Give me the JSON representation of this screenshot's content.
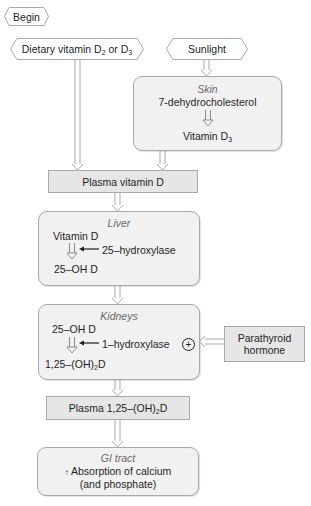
{
  "diagram": {
    "start": {
      "label": "Begin"
    },
    "sources": {
      "dietary": {
        "text": "Dietary vitamin D",
        "sub1": "2",
        "mid": " or D",
        "sub2": "3"
      },
      "sunlight": {
        "label": "Sunlight"
      }
    },
    "skin": {
      "title": "Skin",
      "substrate": "7-dehydrocholesterol",
      "product": {
        "text": "Vitamin D",
        "sub": "3"
      }
    },
    "plasma_vitamin_d": {
      "label": "Plasma vitamin D"
    },
    "liver": {
      "title": "Liver",
      "substrate": "Vitamin D",
      "enzyme": "25–hydroxylase",
      "product": "25–OH D"
    },
    "kidneys": {
      "title": "Kidneys",
      "substrate": "25–OH D",
      "enzyme": "1–hydroxylase",
      "stimulus_symbol": "+",
      "product": {
        "pre": "1,25–(OH)",
        "sub": "2",
        "post": "D"
      }
    },
    "parathyroid": {
      "line1": "Parathyroid",
      "line2": "hormone"
    },
    "plasma_calcitriol": {
      "pre": "Plasma 1,25–(OH)",
      "sub": "2",
      "post": "D"
    },
    "gi_tract": {
      "title": "GI tract",
      "line1_arrow": "↑",
      "line1": " Absorption of calcium",
      "line2": "(and phosphate)"
    },
    "colors": {
      "box_fill": "#f1f1f1",
      "rect_fill": "#e6e6e6",
      "border": "#a9a9a9",
      "title_text": "#6a6a6a",
      "text": "#1f1f1f"
    }
  }
}
